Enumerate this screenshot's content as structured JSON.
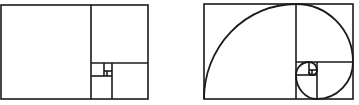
{
  "figure": {
    "stroke_color": "#1a1a1a",
    "background": "#ffffff",
    "panels": [
      {
        "name": "golden-rectangle-squares",
        "has_spiral": false
      },
      {
        "name": "golden-rectangle-spiral",
        "has_spiral": true
      }
    ]
  }
}
